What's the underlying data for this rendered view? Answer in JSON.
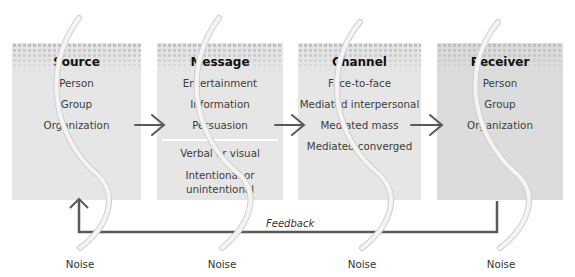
{
  "diagram": {
    "type": "communication-process-model",
    "boxes": [
      {
        "id": "source",
        "title": "Source",
        "items": [
          "Person",
          "Group",
          "Organization"
        ]
      },
      {
        "id": "message",
        "title": "Message",
        "items": [
          "Entertainment",
          "Information",
          "Persuasion"
        ],
        "items_secondary": [
          "Verbal or visual",
          "Intentional or unintentional"
        ]
      },
      {
        "id": "channel",
        "title": "Channel",
        "items": [
          "Face-to-face",
          "Mediated interpersonal",
          "Mediated mass",
          "Mediated converged"
        ]
      },
      {
        "id": "receiver",
        "title": "Receiver",
        "items": [
          "Person",
          "Group",
          "Organization"
        ]
      }
    ],
    "feedback_label": "Feedback",
    "noise_labels": [
      "Noise",
      "Noise",
      "Noise",
      "Noise"
    ],
    "colors": {
      "box_fill": "#e6e6e6",
      "receiver_fill": "#dcdcdc",
      "dot_pattern": "#bdbdbd",
      "arrow": "#5a5a5a",
      "noise_curve": "#f2f2f2",
      "noise_curve_outline": "#cfcfcf"
    }
  }
}
